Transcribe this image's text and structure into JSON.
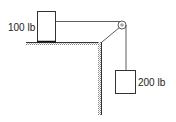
{
  "diagram": {
    "block_on_table": {
      "label": "100 lb"
    },
    "hanging_block": {
      "label": "200 lb"
    },
    "colors": {
      "stroke": "#333333",
      "hatch": "#888888",
      "background": "#ffffff"
    }
  }
}
